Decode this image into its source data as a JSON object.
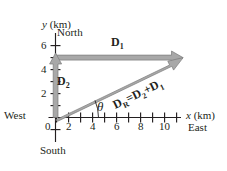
{
  "figure": {
    "type": "vector-diagram",
    "background_color": "#ffffff",
    "arrow_fill": "#a6a6a6",
    "arrow_stroke": "#6e6e6e",
    "axis_color": "#231f20"
  },
  "axes": {
    "x": {
      "label": "x (km)",
      "label_italic_part": "x",
      "label_rest": " (km)",
      "min": -0.6,
      "max": 11.2,
      "ticks": [
        0,
        1,
        2,
        3,
        4,
        5,
        6,
        7,
        8,
        9,
        10,
        11
      ],
      "tick_labels": [
        {
          "value": 0,
          "text": "0"
        },
        {
          "value": 2,
          "text": "2"
        },
        {
          "value": 4,
          "text": "4"
        },
        {
          "value": 6,
          "text": "6"
        },
        {
          "value": 8,
          "text": "8"
        },
        {
          "value": 10,
          "text": "10"
        }
      ]
    },
    "y": {
      "label": "y (km)",
      "label_italic_part": "y",
      "label_rest": " (km)",
      "min": -1.6,
      "max": 6.9,
      "ticks": [
        -1,
        0,
        1,
        2,
        3,
        4,
        5,
        6
      ],
      "tick_labels": [
        {
          "value": 2,
          "text": "2"
        },
        {
          "value": 4,
          "text": "4"
        },
        {
          "value": 6,
          "text": "6"
        }
      ]
    }
  },
  "compass": {
    "north": "North",
    "south": "South",
    "east": "East",
    "west": "West"
  },
  "vectors": [
    {
      "name": "D1",
      "label_base": "D",
      "label_sub": "1",
      "from": [
        0,
        5
      ],
      "to": [
        10.5,
        5
      ],
      "description": "horizontal vector pointing east at y = 5 km"
    },
    {
      "name": "D2",
      "label_base": "D",
      "label_sub": "2",
      "from": [
        0,
        0
      ],
      "to": [
        0,
        5
      ],
      "description": "vertical vector pointing north along the y axis"
    },
    {
      "name": "DR",
      "label_base": "D",
      "label_sub": "R",
      "label_equation": "D_R = D_2 + D_1",
      "from": [
        0,
        0
      ],
      "to": [
        10.5,
        5
      ],
      "description": "resultant vector from origin to tip of D1"
    }
  ],
  "angle": {
    "symbol": "θ",
    "at": [
      0,
      0
    ],
    "between": [
      "x-axis",
      "DR"
    ]
  },
  "equation": {
    "lhs_base": "D",
    "lhs_sub": "R",
    "equals": "=",
    "term1_base": "D",
    "term1_sub": "2",
    "plus": "+",
    "term2_base": "D",
    "term2_sub": "1"
  }
}
